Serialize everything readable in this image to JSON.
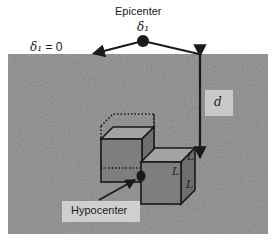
{
  "labels": {
    "epicenter": "Epicenter",
    "delta_epicenter": "δ₁",
    "delta_zero_symbol": "δ₁",
    "delta_zero_value": " = 0",
    "depth": "d",
    "hypocenter": "Hypocenter",
    "cube_edge_1": "L",
    "cube_edge_2": "L",
    "cube_edge_3": "L"
  },
  "colors": {
    "ground": "#8a8a8a",
    "ground_dark": "#5e5e5e",
    "cube_face": "#7d7d7d",
    "cube_top": "#9a9a9a",
    "cube_side": "#6e6e6e",
    "line": "#1a1a1a",
    "label_box": "#c9c9c9"
  }
}
